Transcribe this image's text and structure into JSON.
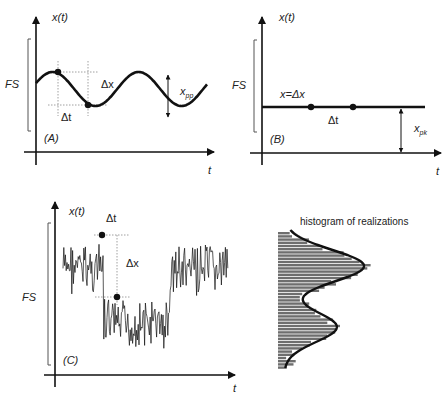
{
  "panels": {
    "A": {
      "tag": "(A)",
      "y_axis_label": "x(t)",
      "x_axis_label": "t",
      "fs_label": "FS",
      "delta_x_label": "Δx",
      "delta_t_label": "Δt",
      "amplitude_label": "x",
      "amplitude_sub": "pp",
      "description": "sinusoidal signal with peak-to-peak amplitude"
    },
    "B": {
      "tag": "(B)",
      "y_axis_label": "x(t)",
      "x_axis_label": "t",
      "fs_label": "FS",
      "level_label": "x=Δx",
      "delta_t_label": "Δt",
      "amplitude_label": "x",
      "amplitude_sub": "pk",
      "description": "constant signal"
    },
    "C": {
      "tag": "(C)",
      "y_axis_label": "x(t)",
      "x_axis_label": "t",
      "fs_label": "FS",
      "delta_x_label": "Δx",
      "delta_t_label": "Δt",
      "description": "noisy step signal"
    },
    "histogram": {
      "title": "histogram of realizations",
      "description": "bimodal distribution with fitted density curve"
    }
  },
  "colors": {
    "ink": "#111111",
    "bar_fill": "#6e6e6e",
    "guide": "#777777"
  }
}
